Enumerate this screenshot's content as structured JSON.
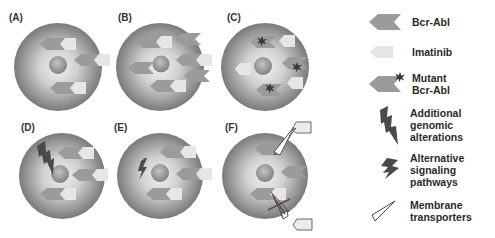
{
  "panels": [
    {
      "label": "(A)",
      "scenario": "Bcr-Abl inhibited by imatinib"
    },
    {
      "label": "(B)",
      "scenario": "Bcr-Abl overexpression"
    },
    {
      "label": "(C)",
      "scenario": "Bcr-Abl kinase domain mutations"
    },
    {
      "label": "(D)",
      "scenario": "Additional genomic alterations"
    },
    {
      "label": "(E)",
      "scenario": "Alternative signaling pathways"
    },
    {
      "label": "(F)",
      "scenario": "Membrane transporters"
    }
  ],
  "legend": {
    "items": [
      {
        "icon": "bcr-abl-arrow-icon",
        "label_lines": [
          "Bcr-Abl"
        ]
      },
      {
        "icon": "imatinib-icon",
        "label_lines": [
          "Imatinib"
        ]
      },
      {
        "icon": "mutant-bcr-abl-icon",
        "label_lines": [
          "Mutant",
          "Bcr-Abl"
        ]
      },
      {
        "icon": "lightning-genomic-icon",
        "label_lines": [
          "Additional",
          "genomic",
          "alterations"
        ]
      },
      {
        "icon": "lightning-signaling-icon",
        "label_lines": [
          "Alternative",
          "signaling",
          "pathways"
        ]
      },
      {
        "icon": "transporter-cone-icon",
        "label_lines": [
          "Membrane",
          "transporters"
        ]
      }
    ]
  },
  "colors": {
    "cell_outer": "#7d7d7d",
    "cell_inner": "#e6e6e6",
    "nucleus": "#9a9a9a",
    "bcr_abl": "#9b9b9b",
    "imatinib": "#e4e4e4",
    "mutation": "#3a3a3a",
    "lightning": "#4a4a4a"
  }
}
